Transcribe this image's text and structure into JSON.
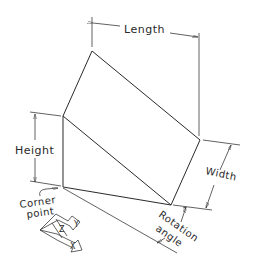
{
  "diagram": {
    "type": "isometric-wedge-dimension-drawing",
    "labels": {
      "length": "Length",
      "height": "Height",
      "width": "Width",
      "corner_point_line1": "Corner",
      "corner_point_line2": "point",
      "rotation_line1": "Rotation",
      "rotation_line2": "angle"
    },
    "axes": {
      "x": "X",
      "y": "Y",
      "z": "Z"
    },
    "colors": {
      "line": "#2a2a2a",
      "background": "#ffffff"
    }
  }
}
